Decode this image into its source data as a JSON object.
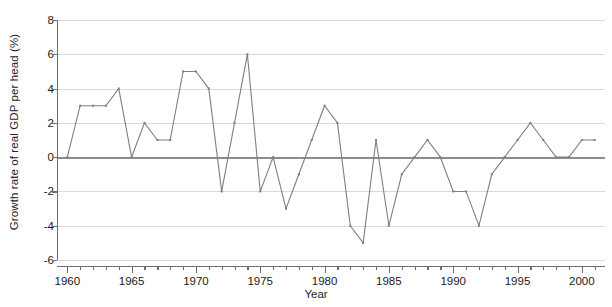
{
  "chart_data": {
    "type": "line",
    "title": "",
    "xlabel": "Year",
    "ylabel": "Growth rate of real GDP per head (%)",
    "xlim": [
      1959.2,
      2001.8
    ],
    "ylim": [
      -6,
      8
    ],
    "yticks": [
      8,
      6,
      4,
      2,
      0,
      -2,
      -4,
      -6
    ],
    "ytick_labels": [
      "8",
      "6",
      "4",
      "2",
      "0",
      "-2",
      "-4",
      "-6"
    ],
    "xticks_major": [
      1960,
      1965,
      1970,
      1975,
      1980,
      1985,
      1990,
      1995,
      2000
    ],
    "xtick_labels": [
      "1960",
      "1965",
      "1970",
      "1975",
      "1980",
      "1985",
      "1990",
      "1995",
      "2000"
    ],
    "xticks_minor_step": 1,
    "grid": "horizontal",
    "legend": "none",
    "zero_line": true,
    "line_color": "#7f7f7f",
    "grid_color": "#d9d9d9",
    "axis_color": "#6e6e6e",
    "x": [
      1960,
      1961,
      1962,
      1963,
      1964,
      1965,
      1966,
      1967,
      1968,
      1969,
      1970,
      1971,
      1972,
      1973,
      1974,
      1975,
      1976,
      1977,
      1978,
      1979,
      1980,
      1981,
      1982,
      1983,
      1984,
      1985,
      1986,
      1987,
      1988,
      1989,
      1990,
      1991,
      1992,
      1993,
      1994,
      1995,
      1996,
      1997,
      1998,
      1999,
      2000,
      2001
    ],
    "values": [
      0,
      3,
      3,
      3,
      4,
      0,
      2,
      1,
      1,
      5,
      5,
      4,
      -2,
      2,
      6,
      -2,
      0,
      -3,
      -1,
      1,
      3,
      2,
      -4,
      -5,
      1,
      -4,
      -1,
      0,
      1,
      0,
      -2,
      -2,
      -4,
      -1,
      0,
      1,
      2,
      1,
      0,
      0,
      1,
      1
    ]
  }
}
